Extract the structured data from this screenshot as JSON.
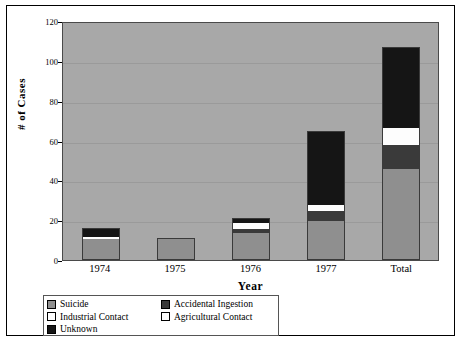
{
  "chart_data": {
    "type": "bar",
    "subtype": "stacked-bar",
    "title": "",
    "xlabel": "Year",
    "ylabel": "# of Cases",
    "categories": [
      "1974",
      "1975",
      "1976",
      "1977",
      "Total"
    ],
    "ylim": [
      0,
      120
    ],
    "yticks": [
      0,
      20,
      40,
      60,
      80,
      100,
      120
    ],
    "grid": true,
    "legend_position": "bottom-left",
    "series": [
      {
        "name": "Suicide",
        "color": "#8f8f8f",
        "values": [
          10,
          10,
          13,
          19,
          45
        ]
      },
      {
        "name": "Accidental Ingestion",
        "color": "#3a3a3a",
        "values": [
          0,
          0,
          2,
          5,
          12
        ]
      },
      {
        "name": "Industrial Contact",
        "color": "#ffffff",
        "values": [
          1,
          0,
          0,
          0,
          1
        ]
      },
      {
        "name": "Agricultural Contact",
        "color": "#fdfdfd",
        "values": [
          0,
          0,
          3,
          3,
          8
        ]
      },
      {
        "name": "Unknown",
        "color": "#151515",
        "values": [
          4,
          0,
          2,
          37,
          40
        ]
      }
    ],
    "totals": [
      15,
      10,
      20,
      64,
      106
    ]
  },
  "legend": {
    "items": [
      {
        "label": "Suicide",
        "swatch": "#8f8f8f"
      },
      {
        "label": "Accidental Ingestion",
        "swatch": "#3a3a3a"
      },
      {
        "label": "Industrial Contact",
        "swatch": "#ffffff"
      },
      {
        "label": "Agricultural Contact",
        "swatch": "#fdfdfd"
      },
      {
        "label": "Unknown",
        "swatch": "#151515"
      }
    ]
  },
  "plot": {
    "background": "#a8a8a8",
    "gridline_color": "#9a9a9a",
    "border_color": "#4a4a4a"
  }
}
